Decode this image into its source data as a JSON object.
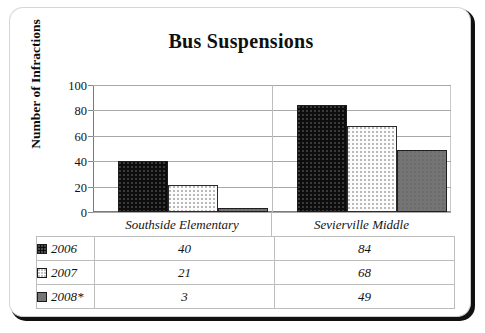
{
  "frame": {
    "corner_style": "rounded",
    "shadow_color": "#111114"
  },
  "chart_data": {
    "type": "bar",
    "title": "Bus Suspensions",
    "xlabel": "",
    "ylabel": "Number of Infractions",
    "ylim": [
      0,
      100
    ],
    "yticks": [
      0,
      20,
      40,
      60,
      80,
      100
    ],
    "grid": true,
    "legend_position": "data-table-below",
    "categories": [
      "Southside Elementary",
      "Sevierville Middle"
    ],
    "series": [
      {
        "name": "2006",
        "values": [
          40,
          84
        ],
        "color": "#0d0d0d",
        "pattern": "dotted-dark"
      },
      {
        "name": "2007",
        "values": [
          21,
          68
        ],
        "color": "#fcfcfc",
        "pattern": "dotted-light"
      },
      {
        "name": "2008*",
        "values": [
          3,
          49
        ],
        "color": "#757575",
        "pattern": "solid-gray"
      }
    ]
  },
  "ytick_labels": [
    "100",
    "80",
    "60",
    "40",
    "20",
    "0"
  ],
  "table": {
    "row_labels": [
      "2006",
      "2007",
      "2008*"
    ],
    "rows": [
      {
        "label": "2006",
        "cells": [
          "40",
          "84"
        ]
      },
      {
        "label": "2007",
        "cells": [
          "21",
          "68"
        ]
      },
      {
        "label": "2008*",
        "cells": [
          "3",
          "49"
        ]
      }
    ]
  }
}
